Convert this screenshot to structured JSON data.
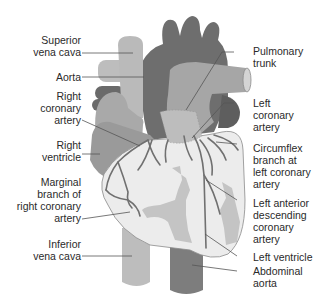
{
  "diagram": {
    "type": "anatomical-illustration",
    "colors": {
      "background": "#ffffff",
      "aorta_dark": "#6e6e6e",
      "vessel_light": "#b8b8b8",
      "pulmonary_trunk": "#a6a6a6",
      "right_ventricle": "#a9a9a9",
      "ventricle_surface": "#ececec",
      "fat_patches": "#c4c4c4",
      "coronary_vessels": "#707070",
      "abdominal_aorta": "#808080",
      "leader_lines": "#555555",
      "text": "#2a2a2a"
    },
    "labels": {
      "left": [
        {
          "id": "superior-vena-cava",
          "text": "Superior\nvena cava"
        },
        {
          "id": "aorta",
          "text": "Aorta"
        },
        {
          "id": "right-coronary-artery",
          "text": "Right\ncoronary\nartery"
        },
        {
          "id": "right-ventricle",
          "text": "Right\nventricle"
        },
        {
          "id": "marginal-branch",
          "text": "Marginal\nbranch of\nright coronary\nartery"
        },
        {
          "id": "inferior-vena-cava",
          "text": "Inferior\nvena cava"
        }
      ],
      "right": [
        {
          "id": "pulmonary-trunk",
          "text": "Pulmonary\ntrunk"
        },
        {
          "id": "left-coronary-artery",
          "text": "Left\ncoronary\nartery"
        },
        {
          "id": "circumflex-branch",
          "text": "Circumflex\nbranch at\nleft coronary\nartery"
        },
        {
          "id": "left-anterior-descending",
          "text": "Left anterior\ndescending\ncoronary\nartery"
        },
        {
          "id": "left-ventricle",
          "text": "Left ventricle"
        },
        {
          "id": "abdominal-aorta",
          "text": "Abdominal\naorta"
        }
      ]
    }
  }
}
